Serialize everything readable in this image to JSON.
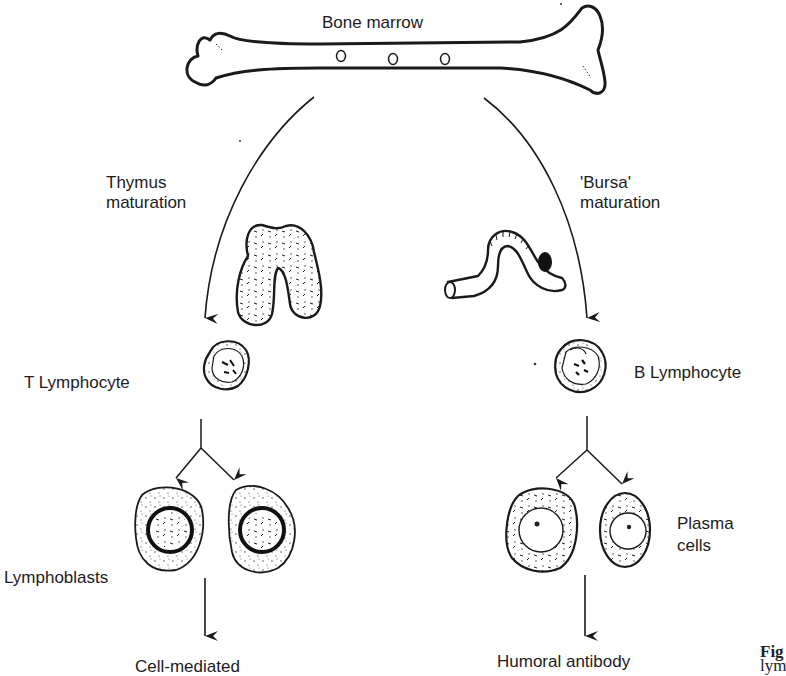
{
  "diagram": {
    "title": "Bone marrow",
    "left_branch": {
      "pathway_label_line1": "Thymus",
      "pathway_label_line2": "maturation",
      "organ": "thymus",
      "cell_label": "T Lymphocyte",
      "daughter_label": "Lymphoblasts",
      "outcome": "Cell-mediated"
    },
    "right_branch": {
      "pathway_label_line1": "'Bursa'",
      "pathway_label_line2": "maturation",
      "organ": "bursa",
      "cell_label": "B Lymphocyte",
      "daughter_label_line1": "Plasma",
      "daughter_label_line2": "cells",
      "outcome": "Humoral antibody"
    },
    "caption_fragment_bold": "Fig",
    "caption_fragment_text": "lym",
    "colors": {
      "ink": "#1a1a1a",
      "background": "#ffffff",
      "bursa_spot": "#111111"
    }
  }
}
